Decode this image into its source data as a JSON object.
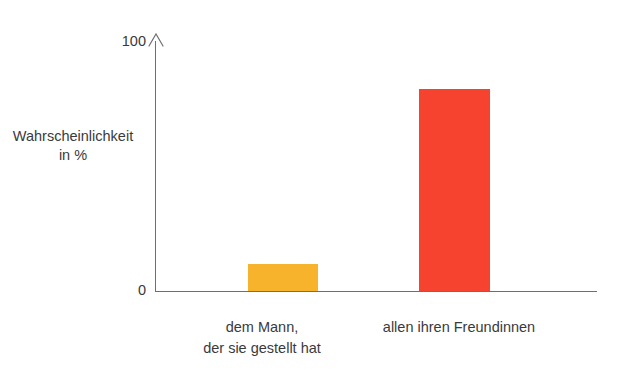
{
  "chart_data": {
    "type": "bar",
    "title": "",
    "xlabel": "",
    "ylabel": "Wahrscheinlichkeit in %",
    "ylabel_lines": [
      "Wahrscheinlichkeit",
      "in %"
    ],
    "ylim": [
      0,
      100
    ],
    "yticks": [
      0,
      100
    ],
    "ytick_labels": [
      "0",
      "100"
    ],
    "grid": false,
    "legend": "none",
    "axis_style": "y-axis arrow to 100, x-axis baseline at 0",
    "categories": [
      "dem Mann, der sie gestellt hat",
      "allen ihren Freundinnen"
    ],
    "category_label_lines": [
      [
        "dem Mann,",
        "der sie gestellt hat"
      ],
      [
        "allen ihren Freundinnen"
      ]
    ],
    "values": [
      11,
      81
    ],
    "colors": [
      "#f7b32b",
      "#f6432f"
    ],
    "bars": [
      {
        "category": "dem Mann, der sie gestellt hat",
        "value": 11,
        "color": "#f7b32b",
        "left_px": 92,
        "width_px": 70
      },
      {
        "category": "allen ihren Freundinnen",
        "value": 81,
        "color": "#f6432f",
        "left_px": 263,
        "width_px": 71
      }
    ]
  },
  "axis": {
    "y_title_line1": "Wahrscheinlichkeit",
    "y_title_line2": "in %",
    "tick_top": "100",
    "tick_bottom": "0",
    "line_color": "#6f6f73"
  },
  "categories": [
    {
      "line1": "dem Mann,",
      "line2": "der sie gestellt hat"
    },
    {
      "line1": "allen ihren Freundinnen",
      "line2": ""
    }
  ],
  "colors": {
    "bar_orange": "#f7b32b",
    "bar_red": "#f6432f",
    "text": "#3a3a3c",
    "axis": "#6f6f73",
    "background": "#ffffff"
  }
}
